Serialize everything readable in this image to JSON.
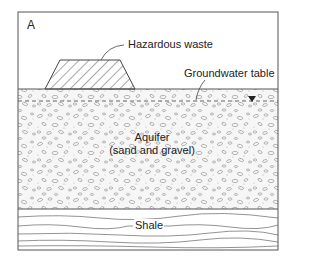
{
  "diagram": {
    "panel_label": "A",
    "labels": {
      "hazardous_waste": "Hazardous waste",
      "groundwater_table": "Groundwater table",
      "aquifer_line1": "Aquifer",
      "aquifer_line2": "(sand and gravel)",
      "shale": "Shale"
    },
    "layers": [
      {
        "name": "air",
        "fill": "#ffffff"
      },
      {
        "name": "aquifer",
        "material": "sand and gravel",
        "fill": "#f4f4f4",
        "pattern": "pebbles"
      },
      {
        "name": "shale",
        "fill": "#ffffff",
        "pattern": "wavy-lines"
      }
    ],
    "symbols": {
      "water_table_marker": "▼"
    },
    "colors": {
      "stroke": "#555555",
      "text": "#222222",
      "pebble": "#9a9a9a"
    }
  }
}
